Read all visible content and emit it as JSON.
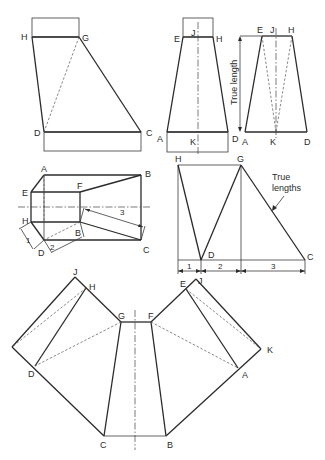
{
  "figure": {
    "elevation_view": {
      "labels": {
        "H": "H",
        "G": "G",
        "D": "D",
        "C": "C"
      }
    },
    "front_view": {
      "labels": {
        "E": "E",
        "J": "J",
        "H": "H",
        "A": "A",
        "K": "K",
        "D": "D"
      }
    },
    "side_view": {
      "labels": {
        "E": "E",
        "J": "J",
        "H": "H",
        "A": "A",
        "K": "K",
        "D": "D"
      },
      "annotation": "True length"
    },
    "plan_view": {
      "labels": {
        "A": "A",
        "B_big": "B",
        "E": "E",
        "F": "F",
        "H": "H",
        "D": "D",
        "B_small": "B",
        "C": "C"
      },
      "dimensions": [
        "1",
        "2",
        "3"
      ]
    },
    "true_length_diagram": {
      "labels": {
        "H": "H",
        "G": "G",
        "D": "D",
        "C": "C"
      },
      "annotation_line1": "True",
      "annotation_line2": "lengths",
      "dimensions": [
        "1",
        "2",
        "3"
      ]
    },
    "development": {
      "labels": {
        "J_left": "J",
        "H": "H",
        "G": "G",
        "F": "F",
        "E": "E",
        "J_right": "J",
        "K": "K",
        "D": "D",
        "A": "A",
        "C": "C",
        "B": "B"
      }
    }
  }
}
